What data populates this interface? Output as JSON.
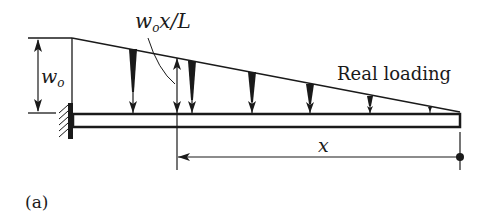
{
  "figure": {
    "panel_label": "(a)",
    "load_label_prefix": "w",
    "load_label_sub": "o",
    "load_label_suffix": "x/L",
    "intensity_label": "w",
    "intensity_sub": "o",
    "loading_title": "Real loading",
    "distance_label": "x",
    "colors": {
      "ink": "#1a1a1a",
      "background": "#ffffff"
    }
  }
}
